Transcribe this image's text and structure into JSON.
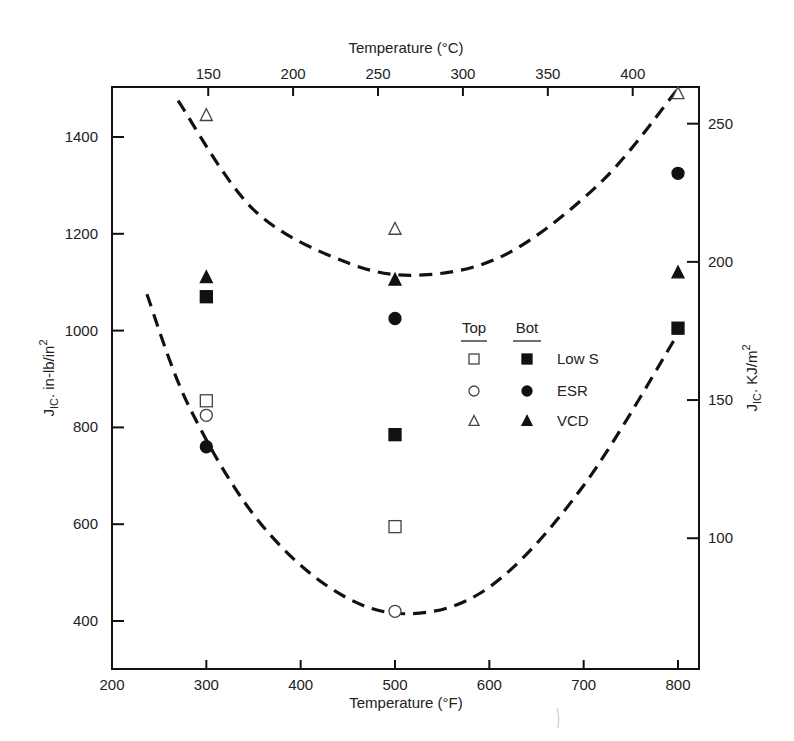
{
  "chart_data": {
    "type": "scatter",
    "title": "",
    "xlabel": "Temperature (°F)",
    "x2label": "Temperature (°C)",
    "ylabel": "J_IC, in-lb/in^2",
    "y2label": "J_IC, KJ/m^2",
    "xlim": [
      200,
      820
    ],
    "ylim": [
      300,
      1500
    ],
    "xticks": [
      200,
      300,
      400,
      500,
      600,
      700,
      800
    ],
    "x2ticks": [
      150,
      200,
      250,
      300,
      350,
      400
    ],
    "yticks": [
      400,
      600,
      800,
      1000,
      1200,
      1400
    ],
    "y2ticks": [
      100,
      150,
      200,
      250
    ],
    "grid": false,
    "legend": {
      "position": "center-right",
      "column_headers": [
        "Top",
        "Bot"
      ],
      "entries": [
        "Low S",
        "ESR",
        "VCD"
      ]
    },
    "series": [
      {
        "name": "Low S (Top)",
        "marker": "open-square",
        "x": [
          300,
          500
        ],
        "y": [
          855,
          595
        ]
      },
      {
        "name": "ESR (Top)",
        "marker": "open-circle",
        "x": [
          300,
          500
        ],
        "y": [
          825,
          420
        ]
      },
      {
        "name": "VCD (Top)",
        "marker": "open-triangle",
        "x": [
          300,
          500,
          800
        ],
        "y": [
          1445,
          1210,
          1490
        ]
      },
      {
        "name": "Low S (Bot)",
        "marker": "filled-square",
        "x": [
          300,
          500,
          800
        ],
        "y": [
          1070,
          785,
          1005
        ]
      },
      {
        "name": "ESR (Bot)",
        "marker": "filled-circle",
        "x": [
          300,
          500,
          800
        ],
        "y": [
          760,
          1025,
          1325
        ]
      },
      {
        "name": "VCD (Bot)",
        "marker": "filled-triangle",
        "x": [
          300,
          500,
          800
        ],
        "y": [
          1110,
          1105,
          1120
        ]
      }
    ],
    "trend_curves": [
      {
        "name": "upper-band",
        "style": "dashed",
        "points": [
          [
            270,
            1475
          ],
          [
            350,
            1250
          ],
          [
            450,
            1140
          ],
          [
            530,
            1115
          ],
          [
            620,
            1160
          ],
          [
            720,
            1310
          ],
          [
            800,
            1500
          ]
        ]
      },
      {
        "name": "lower-band",
        "style": "dashed",
        "points": [
          [
            237,
            1075
          ],
          [
            280,
            850
          ],
          [
            350,
            620
          ],
          [
            430,
            470
          ],
          [
            510,
            415
          ],
          [
            600,
            470
          ],
          [
            700,
            680
          ],
          [
            805,
            1010
          ]
        ]
      }
    ]
  },
  "axes": {
    "bottom": {
      "title": "Temperature (°F)",
      "ticks": [
        "200",
        "300",
        "400",
        "500",
        "600",
        "700",
        "800"
      ]
    },
    "top": {
      "title": "Temperature (°C)",
      "ticks": [
        "150",
        "200",
        "250",
        "300",
        "350",
        "400"
      ]
    },
    "left": {
      "title_main": "J",
      "title_sub": "IC",
      "title_rest": ". in-lb/in",
      "title_sup": "2",
      "ticks": [
        "400",
        "600",
        "800",
        "1000",
        "1200",
        "1400"
      ]
    },
    "right": {
      "title_main": "J",
      "title_sub": "IC",
      "title_rest": ". KJ/m",
      "title_sup": "2",
      "ticks": [
        "100",
        "150",
        "200",
        "250"
      ]
    }
  },
  "legend": {
    "header_top": "Top",
    "header_bot": "Bot",
    "rows": [
      {
        "label": "Low S",
        "top_marker": "open-square-icon",
        "bot_marker": "filled-square-icon"
      },
      {
        "label": "ESR",
        "top_marker": "open-circle-icon",
        "bot_marker": "filled-circle-icon"
      },
      {
        "label": "VCD",
        "top_marker": "open-triangle-icon",
        "bot_marker": "filled-triangle-icon"
      }
    ]
  }
}
